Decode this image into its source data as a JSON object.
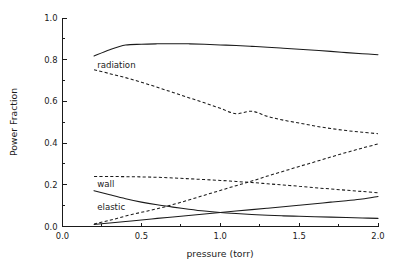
{
  "chart_data": {
    "type": "line",
    "title": "",
    "xlabel": "pressure (torr)",
    "ylabel": "Power Fraction",
    "xlim": [
      0.0,
      2.0
    ],
    "ylim": [
      0.0,
      1.0
    ],
    "grid": false,
    "legend_position": "inline-annotations",
    "xticks": [
      "0.0",
      "0.5",
      "1.0",
      "1.5",
      "2.0"
    ],
    "xtick_values": [
      0.0,
      0.5,
      1.0,
      1.5,
      2.0
    ],
    "yticks": [
      "0.0",
      "0.2",
      "0.4",
      "0.6",
      "0.8",
      "1.0"
    ],
    "ytick_values": [
      0.0,
      0.2,
      0.4,
      0.6,
      0.8,
      1.0
    ],
    "x_minor_step": 0.25,
    "y_minor_step": 0.1,
    "x": [
      0.2,
      0.3,
      0.4,
      0.5,
      0.6,
      0.7,
      0.8,
      0.9,
      1.0,
      1.1,
      1.2,
      1.3,
      1.4,
      1.5,
      1.6,
      1.7,
      1.8,
      1.9,
      2.0
    ],
    "series": [
      {
        "name": "radiation",
        "style": "solid",
        "color": "#1a1a1a",
        "values": [
          0.818,
          0.848,
          0.87,
          0.874,
          0.876,
          0.877,
          0.876,
          0.874,
          0.871,
          0.868,
          0.864,
          0.86,
          0.855,
          0.85,
          0.845,
          0.84,
          0.834,
          0.829,
          0.824
        ]
      },
      {
        "name": "series-dashed-upper",
        "style": "dashed",
        "color": "#1a1a1a",
        "values": [
          0.752,
          0.733,
          0.714,
          0.692,
          0.668,
          0.643,
          0.618,
          0.593,
          0.567,
          0.541,
          0.553,
          0.528,
          0.51,
          0.496,
          0.482,
          0.47,
          0.46,
          0.452,
          0.445
        ]
      },
      {
        "name": "wall",
        "style": "dashed",
        "color": "#1a1a1a",
        "values": [
          0.24,
          0.24,
          0.239,
          0.238,
          0.236,
          0.233,
          0.229,
          0.225,
          0.221,
          0.216,
          0.211,
          0.205,
          0.199,
          0.193,
          0.186,
          0.18,
          0.174,
          0.168,
          0.162
        ]
      },
      {
        "name": "series-dashed-rising",
        "style": "dashed",
        "color": "#1a1a1a",
        "values": [
          0.012,
          0.03,
          0.05,
          0.068,
          0.085,
          0.105,
          0.127,
          0.15,
          0.173,
          0.196,
          0.218,
          0.242,
          0.265,
          0.288,
          0.31,
          0.333,
          0.355,
          0.376,
          0.396
        ]
      },
      {
        "name": "elastic",
        "style": "solid",
        "color": "#1a1a1a",
        "values": [
          0.172,
          0.152,
          0.133,
          0.117,
          0.104,
          0.093,
          0.083,
          0.074,
          0.067,
          0.062,
          0.058,
          0.054,
          0.051,
          0.049,
          0.047,
          0.045,
          0.043,
          0.041,
          0.039
        ]
      },
      {
        "name": "series-solid-rising",
        "style": "solid",
        "color": "#1a1a1a",
        "values": [
          0.01,
          0.017,
          0.024,
          0.031,
          0.039,
          0.046,
          0.053,
          0.06,
          0.067,
          0.074,
          0.081,
          0.088,
          0.095,
          0.102,
          0.109,
          0.117,
          0.124,
          0.132,
          0.144
        ]
      }
    ],
    "annotations": [
      {
        "text": "radiation",
        "x": 0.22,
        "y": 0.775
      },
      {
        "text": "wall",
        "x": 0.22,
        "y": 0.205
      },
      {
        "text": "elastic",
        "x": 0.22,
        "y": 0.095
      }
    ]
  },
  "axes": {
    "ylabel": "Power Fraction",
    "xlabel": "pressure (torr)"
  }
}
